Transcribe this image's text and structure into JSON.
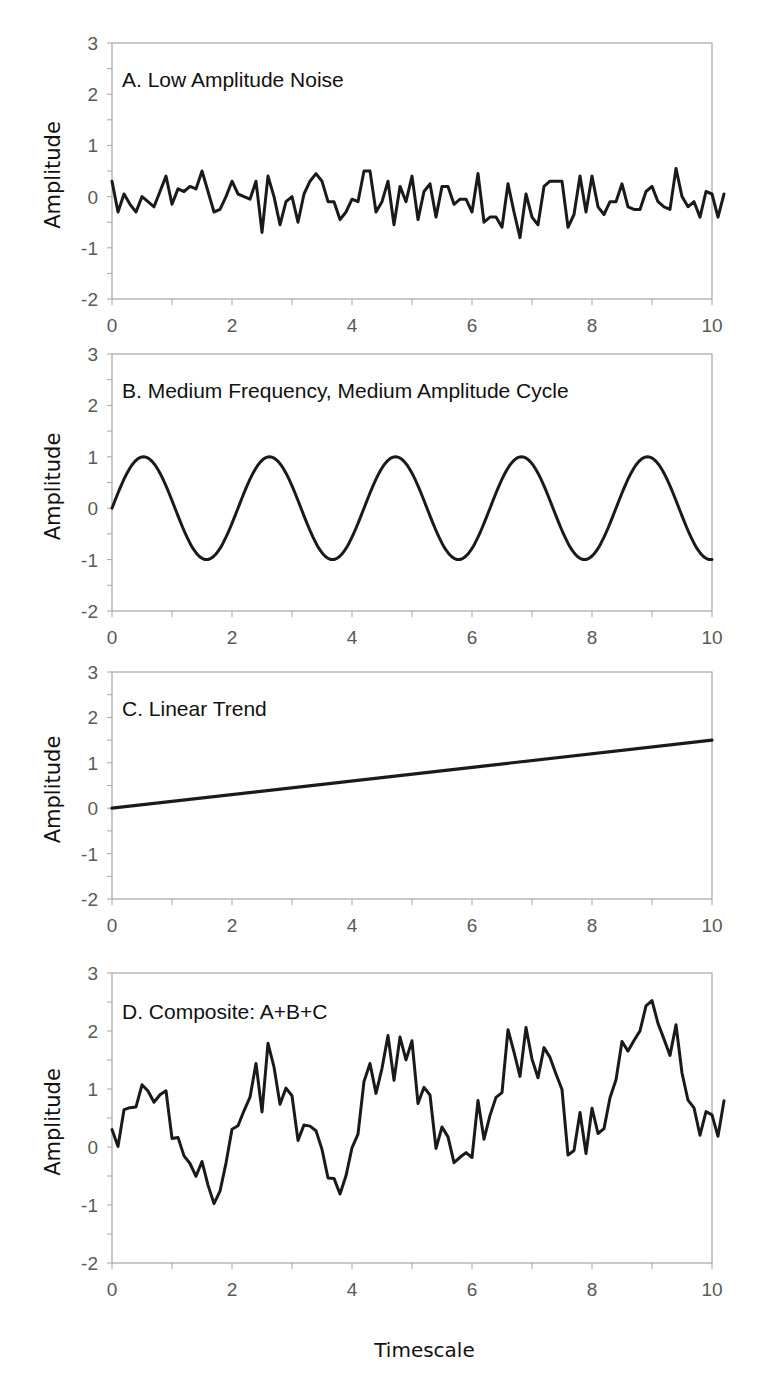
{
  "figure": {
    "x_axis_title": "Timescale",
    "y_axis_title": "Amplitude",
    "line_color": "#1a1a1a",
    "axis_color": "#a6a6a6",
    "tick_label_color": "#595959"
  },
  "chart_data": [
    {
      "type": "line",
      "title": "A. Low Amplitude Noise",
      "xlabel": "",
      "ylabel": "Amplitude",
      "xlim": [
        0,
        10
      ],
      "ylim": [
        -2,
        3
      ],
      "x_ticks": [
        "0",
        "2",
        "4",
        "6",
        "8",
        "10"
      ],
      "y_ticks": [
        "3",
        "2",
        "1",
        "0",
        "-1",
        "-2"
      ],
      "grid": false,
      "x_step": 0.1,
      "values": [
        0.3,
        -0.3,
        0.05,
        -0.15,
        -0.3,
        0.0,
        -0.1,
        -0.2,
        0.1,
        0.4,
        -0.15,
        0.15,
        0.1,
        0.2,
        0.15,
        0.5,
        0.1,
        -0.3,
        -0.25,
        0.0,
        0.3,
        0.05,
        0.0,
        -0.05,
        0.3,
        -0.7,
        0.4,
        0.0,
        -0.55,
        -0.1,
        0.0,
        -0.5,
        0.05,
        0.3,
        0.45,
        0.3,
        -0.1,
        -0.1,
        -0.45,
        -0.3,
        -0.05,
        -0.1,
        0.5,
        0.5,
        -0.3,
        -0.1,
        0.3,
        -0.55,
        0.2,
        -0.1,
        0.4,
        -0.45,
        0.1,
        0.25,
        -0.4,
        0.2,
        0.2,
        -0.15,
        -0.05,
        -0.05,
        -0.3,
        0.45,
        -0.5,
        -0.4,
        -0.4,
        -0.6,
        0.25,
        -0.3,
        -0.8,
        0.05,
        -0.4,
        -0.55,
        0.2,
        0.3,
        0.3,
        0.3,
        -0.6,
        -0.35,
        0.4,
        -0.3,
        0.4,
        -0.2,
        -0.35,
        -0.1,
        -0.1,
        0.25,
        -0.2,
        -0.25,
        -0.25,
        0.1,
        0.2,
        -0.1,
        -0.2,
        -0.25,
        0.55,
        0.0,
        -0.2,
        -0.1,
        -0.4,
        0.1,
        0.05,
        -0.4,
        0.05
      ]
    },
    {
      "type": "line",
      "title": "B. Medium Frequency, Medium Amplitude Cycle",
      "xlabel": "",
      "ylabel": "Amplitude",
      "xlim": [
        0,
        10
      ],
      "ylim": [
        -2,
        3
      ],
      "x_ticks": [
        "0",
        "2",
        "4",
        "6",
        "8",
        "10"
      ],
      "y_ticks": [
        "3",
        "2",
        "1",
        "0",
        "-1",
        "-2"
      ],
      "grid": false,
      "function": "sin(2*pi*x/2.1)",
      "period": 2.1,
      "amplitude": 1,
      "peaks_x": [
        0.525,
        2.625,
        4.725,
        6.825,
        8.925
      ],
      "troughs_x": [
        1.575,
        3.675,
        5.775,
        7.875,
        9.975
      ]
    },
    {
      "type": "line",
      "title": "C. Linear Trend",
      "xlabel": "",
      "ylabel": "Amplitude",
      "xlim": [
        0,
        10
      ],
      "ylim": [
        -2,
        3
      ],
      "x_ticks": [
        "0",
        "2",
        "4",
        "6",
        "8",
        "10"
      ],
      "y_ticks": [
        "3",
        "2",
        "1",
        "0",
        "-1",
        "-2"
      ],
      "grid": false,
      "x": [
        0,
        10
      ],
      "values": [
        0,
        1.5
      ]
    },
    {
      "type": "line",
      "title": "D. Composite: A+B+C",
      "xlabel": "Timescale",
      "ylabel": "Amplitude",
      "xlim": [
        0,
        10
      ],
      "ylim": [
        -2,
        3
      ],
      "x_ticks": [
        "0",
        "2",
        "4",
        "6",
        "8",
        "10"
      ],
      "y_ticks": [
        "3",
        "2",
        "1",
        "0",
        "-1",
        "-2"
      ],
      "grid": false,
      "composition": "A + B + C",
      "approx_peaks": [
        {
          "x": 2.6,
          "y": 1.8
        },
        {
          "x": 4.5,
          "y": 2.0
        },
        {
          "x": 7.0,
          "y": 2.1
        },
        {
          "x": 8.8,
          "y": 2.55
        },
        {
          "x": 9.2,
          "y": 2.6
        }
      ],
      "approx_troughs": [
        {
          "x": 1.7,
          "y": -0.95
        },
        {
          "x": 3.8,
          "y": -0.8
        },
        {
          "x": 5.8,
          "y": -0.45
        },
        {
          "x": 7.9,
          "y": 0.0
        },
        {
          "x": 9.9,
          "y": 0.05
        }
      ]
    }
  ]
}
